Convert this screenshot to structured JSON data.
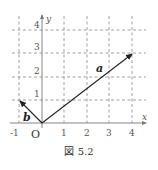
{
  "figure": {
    "caption": "図 5.2",
    "axes": {
      "x_label": "x",
      "y_label": "y",
      "origin_label": "O",
      "x_ticks": [
        "-1",
        "1",
        "2",
        "3",
        "4"
      ],
      "y_ticks": [
        "1",
        "2",
        "3",
        "4"
      ]
    },
    "vectors": [
      {
        "name": "a",
        "from": [
          0,
          0
        ],
        "to": [
          4,
          3
        ]
      },
      {
        "name": "b",
        "from": [
          0,
          0
        ],
        "to": [
          -1,
          1
        ]
      }
    ],
    "colors": {
      "axis": "#777777",
      "grid": "#888888",
      "vector": "#222222",
      "text": "#333333"
    }
  }
}
